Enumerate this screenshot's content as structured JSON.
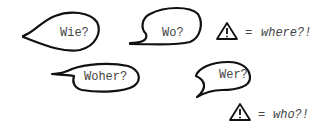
{
  "bubbles": [
    {
      "id": "wie",
      "text": "Wie?"
    },
    {
      "id": "wo",
      "text": "Wo?"
    },
    {
      "id": "woher",
      "text": "Woher?"
    },
    {
      "id": "wer",
      "text": "Wer?"
    }
  ],
  "legend": [
    {
      "symbol": "warning-triangle",
      "equals": "=",
      "meaning": "where?!"
    },
    {
      "symbol": "warning-triangle",
      "equals": "=",
      "meaning": "who?!"
    }
  ]
}
